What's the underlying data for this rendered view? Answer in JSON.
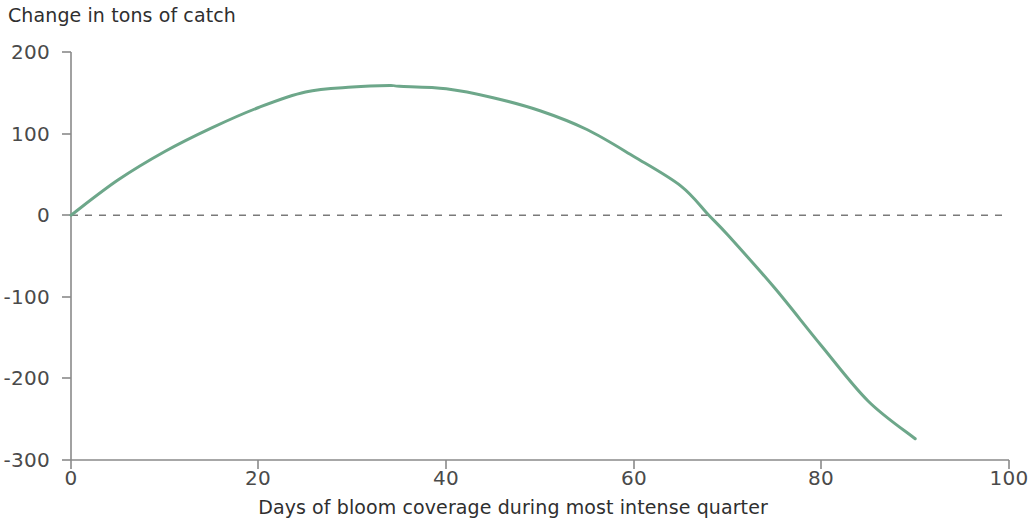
{
  "chart_data": {
    "type": "line",
    "title": "Change in tons of catch",
    "xlabel": "Days of bloom coverage during most intense quarter",
    "ylabel": "Change in tons of catch",
    "xlim": [
      0,
      100
    ],
    "ylim": [
      -300,
      200
    ],
    "xticks": [
      0,
      20,
      40,
      60,
      80,
      100
    ],
    "yticks": [
      200,
      100,
      0,
      -100,
      -200,
      -300
    ],
    "xtick_labels": [
      "0",
      "20",
      "40",
      "60",
      "80",
      "100"
    ],
    "ytick_labels": [
      "200",
      "100",
      "0",
      "-100",
      "-200",
      "-300"
    ],
    "grid": false,
    "legend": null,
    "series": [
      {
        "name": "Change in tons of catch",
        "color": "#6da78a",
        "linewidth": 3,
        "x": [
          0,
          5,
          10,
          15,
          20,
          25,
          30,
          34,
          35,
          40,
          45,
          50,
          55,
          60,
          65,
          68,
          70,
          75,
          80,
          85,
          90
        ],
        "values": [
          0,
          43,
          78,
          107,
          132,
          151,
          157,
          159,
          158,
          155,
          144,
          128,
          105,
          72,
          36,
          0,
          -24,
          -89,
          -160,
          -228,
          -274
        ]
      }
    ],
    "reference_lines": [
      {
        "name": "zero-line",
        "axis": "y",
        "value": 0,
        "style": "dashed",
        "color": "#7a7a7a"
      }
    ]
  }
}
